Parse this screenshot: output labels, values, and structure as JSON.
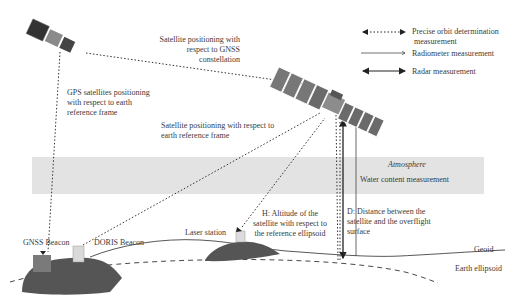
{
  "legend": {
    "items": [
      {
        "id": "orbit",
        "label_line1": "Precise orbit determination",
        "label_line2": "measurement",
        "style": "dotted-double-arrow"
      },
      {
        "id": "radiometer",
        "label": "Radiometer measurement",
        "style": "thin-single-arrow"
      },
      {
        "id": "radar",
        "label": "Radar measurement",
        "style": "solid-double-arrow"
      }
    ]
  },
  "labels": {
    "sat_gnss_line1": "Satellite positioning with",
    "sat_gnss_line2": "respect to GNSS",
    "sat_gnss_line3": "constellation",
    "gps_line1": "GPS satellites positioning",
    "gps_line2": "with respect to earth",
    "gps_line3": "reference frame",
    "sat_earth_line1": "Satellite positioning with respect to",
    "sat_earth_line2": "earth reference frame",
    "atmosphere": "Atmosphere",
    "water": "Water content measurement",
    "altitude_line1": "H: Altitude of the",
    "altitude_line2": "satellite with respect to",
    "altitude_line3": "the reference ellipsoid",
    "distance_line1": "D: Distance between the",
    "distance_line2": "satellite and the overflight",
    "distance_line3": "surface",
    "gnss_beacon": "GNSS Beacon",
    "doris_beacon": "DORIS Beacon",
    "laser_station": "Laser station",
    "geoid": "Geoid",
    "earth_ellipsoid": "Earth ellipsoid"
  },
  "colors": {
    "atmosphere_band": "#e3e3e3",
    "land": "#555555",
    "lines": "#333333",
    "gnss_beacon": "#7a7a7a",
    "doris_beacon": "#d9d9d9",
    "laser_station": "#dcdcdc"
  }
}
